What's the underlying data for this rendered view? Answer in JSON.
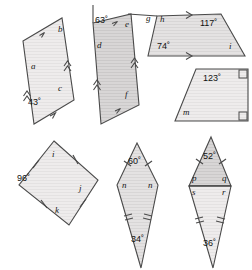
{
  "page": {
    "background": "#ffffff",
    "width": 252,
    "height": 270
  },
  "style": {
    "stroke": "#4a4a4a",
    "fill_light": "#eceaea",
    "fill_mid": "#e2e0e0",
    "fill_dark": "#d2d0d0",
    "label_color": "#161616"
  },
  "figures": [
    {
      "id": "parallelogram-abc",
      "name": "parallelogram-top-left",
      "labels": [
        {
          "key": "a",
          "text": "a",
          "kind": "angle-letter"
        },
        {
          "key": "b",
          "text": "b",
          "kind": "angle-letter"
        },
        {
          "key": "c",
          "text": "c",
          "kind": "angle-letter"
        },
        {
          "key": "angle43",
          "text": "43˚",
          "kind": "angle-value"
        }
      ],
      "marks": [
        "single-arrow",
        "double-arrow"
      ]
    },
    {
      "id": "parallelogram-def",
      "name": "parallelogram-top-middle",
      "labels": [
        {
          "key": "d",
          "text": "d",
          "kind": "angle-letter"
        },
        {
          "key": "e",
          "text": "e",
          "kind": "angle-letter"
        },
        {
          "key": "f",
          "text": "f",
          "kind": "angle-letter"
        },
        {
          "key": "angle63",
          "text": "63˚",
          "kind": "angle-value"
        }
      ],
      "marks": [
        "single-arrow",
        "double-arrow"
      ]
    },
    {
      "id": "trapezium-ghi",
      "name": "trapezium-top-right",
      "labels": [
        {
          "key": "g",
          "text": "g",
          "kind": "angle-letter"
        },
        {
          "key": "h",
          "text": "h",
          "kind": "angle-letter"
        },
        {
          "key": "i_right",
          "text": "i",
          "kind": "angle-letter"
        },
        {
          "key": "angle117",
          "text": "117˚",
          "kind": "angle-value"
        },
        {
          "key": "angle74",
          "text": "74˚",
          "kind": "angle-value"
        }
      ],
      "marks": [
        "single-arrow"
      ]
    },
    {
      "id": "trapezium-m",
      "name": "right-trapezium-middle-right",
      "labels": [
        {
          "key": "angle123",
          "text": "123˚",
          "kind": "angle-value"
        },
        {
          "key": "m",
          "text": "m",
          "kind": "angle-letter"
        }
      ],
      "marks": [
        "right-angle",
        "right-angle"
      ]
    },
    {
      "id": "rhombus-ijk",
      "name": "rhombus-bottom-left",
      "labels": [
        {
          "key": "i_top",
          "text": "i",
          "kind": "angle-letter"
        },
        {
          "key": "j",
          "text": "j",
          "kind": "angle-letter"
        },
        {
          "key": "k",
          "text": "k",
          "kind": "angle-letter"
        },
        {
          "key": "angle96",
          "text": "96˚",
          "kind": "angle-value"
        }
      ],
      "marks": [
        "single-tick",
        "single-tick",
        "single-tick",
        "single-tick"
      ]
    },
    {
      "id": "kite-n",
      "name": "kite-bottom-middle",
      "labels": [
        {
          "key": "angle60",
          "text": "60˚",
          "kind": "angle-value"
        },
        {
          "key": "n_left",
          "text": "n",
          "kind": "angle-letter"
        },
        {
          "key": "n_right",
          "text": "n",
          "kind": "angle-letter"
        },
        {
          "key": "angle34",
          "text": "34˚",
          "kind": "angle-value"
        }
      ],
      "marks": [
        "single-tick",
        "single-tick",
        "double-tick",
        "double-tick"
      ]
    },
    {
      "id": "kite-pqrs",
      "name": "kite-bottom-right",
      "labels": [
        {
          "key": "angle52",
          "text": "52˚",
          "kind": "angle-value"
        },
        {
          "key": "p",
          "text": "p",
          "kind": "angle-letter"
        },
        {
          "key": "q",
          "text": "q",
          "kind": "angle-letter"
        },
        {
          "key": "s",
          "text": "s",
          "kind": "angle-letter"
        },
        {
          "key": "r",
          "text": "r",
          "kind": "angle-letter"
        },
        {
          "key": "angle36",
          "text": "36˚",
          "kind": "angle-value"
        }
      ],
      "marks": [
        "single-tick",
        "single-tick",
        "double-tick",
        "double-tick",
        "diagonal"
      ]
    }
  ],
  "text": {
    "a": "a",
    "b": "b",
    "c": "c",
    "angle43": "43˚",
    "d": "d",
    "e": "e",
    "f": "f",
    "angle63": "63˚",
    "g": "g",
    "h": "h",
    "i_right": "i",
    "angle117": "117˚",
    "angle74": "74˚",
    "angle123": "123˚",
    "m": "m",
    "i_top": "i",
    "j": "j",
    "k": "k",
    "angle96": "96˚",
    "angle60": "60˚",
    "n_left": "n",
    "n_right": "n",
    "angle34": "34˚",
    "angle52": "52˚",
    "p": "p",
    "q": "q",
    "s": "s",
    "r": "r",
    "angle36": "36˚"
  }
}
